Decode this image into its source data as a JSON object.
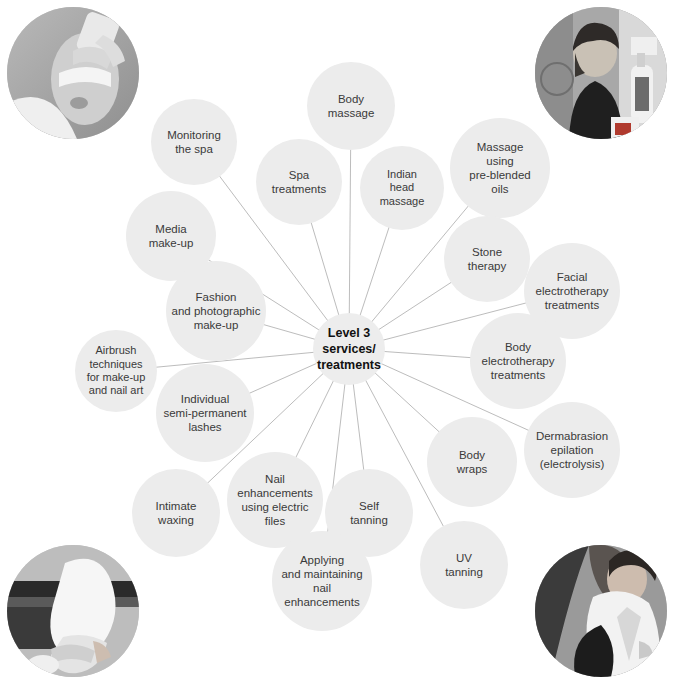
{
  "diagram": {
    "type": "radial-mind-map",
    "canvas": {
      "width": 676,
      "height": 686
    },
    "style": {
      "node_fill": "#ececec",
      "node_text": "#3a3a3a",
      "hub_fill": "#ededed",
      "hub_text": "#111111",
      "edge_color": "#b4b4b4",
      "background": "#ffffff"
    },
    "hub": {
      "label": "Level 3\nservices/\ntreatments",
      "cx": 349,
      "cy": 349,
      "r": 36
    },
    "nodes": [
      {
        "id": "body-massage",
        "label": "Body\nmassage",
        "cx": 351,
        "cy": 106,
        "r": 44
      },
      {
        "id": "monitoring-the-spa",
        "label": "Monitoring\nthe spa",
        "cx": 194,
        "cy": 142,
        "r": 43
      },
      {
        "id": "spa-treatments",
        "label": "Spa\ntreatments",
        "cx": 299,
        "cy": 182,
        "r": 43
      },
      {
        "id": "indian-head-massage",
        "label": "Indian\nhead\nmassage",
        "cx": 402,
        "cy": 188,
        "r": 42
      },
      {
        "id": "massage-pre-blended-oils",
        "label": "Massage\nusing\npre-blended\noils",
        "cx": 500,
        "cy": 168,
        "r": 50
      },
      {
        "id": "media-make-up",
        "label": "Media\nmake-up",
        "cx": 171,
        "cy": 236,
        "r": 45
      },
      {
        "id": "stone-therapy",
        "label": "Stone\ntherapy",
        "cx": 487,
        "cy": 259,
        "r": 43
      },
      {
        "id": "facial-electrotherapy",
        "label": "Facial\nelectrotherapy\ntreatments",
        "cx": 572,
        "cy": 291,
        "r": 48
      },
      {
        "id": "fashion-photographic",
        "label": "Fashion\nand photographic\nmake-up",
        "cx": 216,
        "cy": 311,
        "r": 50
      },
      {
        "id": "airbrush-techniques",
        "label": "Airbrush\ntechniques\nfor make-up\nand nail art",
        "cx": 116,
        "cy": 371,
        "r": 41
      },
      {
        "id": "body-electrotherapy",
        "label": "Body\nelectrotherapy\ntreatments",
        "cx": 518,
        "cy": 361,
        "r": 48
      },
      {
        "id": "individual-lashes",
        "label": "Individual\nsemi-permanent\nlashes",
        "cx": 205,
        "cy": 413,
        "r": 49
      },
      {
        "id": "dermabrasion-epilation",
        "label": "Dermabrasion\nepilation\n(electrolysis)",
        "cx": 572,
        "cy": 450,
        "r": 48
      },
      {
        "id": "body-wraps",
        "label": "Body\nwraps",
        "cx": 472,
        "cy": 462,
        "r": 45
      },
      {
        "id": "nail-enhancements-files",
        "label": "Nail\nenhancements\nusing electric\nfiles",
        "cx": 275,
        "cy": 500,
        "r": 48
      },
      {
        "id": "intimate-waxing",
        "label": "Intimate\nwaxing",
        "cx": 176,
        "cy": 513,
        "r": 44
      },
      {
        "id": "self-tanning",
        "label": "Self\ntanning",
        "cx": 369,
        "cy": 513,
        "r": 44
      },
      {
        "id": "uv-tanning",
        "label": "UV\ntanning",
        "cx": 464,
        "cy": 565,
        "r": 44
      },
      {
        "id": "applying-maintaining",
        "label": "Applying\nand maintaining\nnail\nenhancements",
        "cx": 322,
        "cy": 581,
        "r": 50
      }
    ],
    "photos": [
      {
        "id": "photo-facial-treatment",
        "alt": "facial treatment with eye pads",
        "cx": 73,
        "cy": 73,
        "r": 66,
        "corner": "top-left"
      },
      {
        "id": "photo-therapist-products",
        "alt": "therapist beside product bottles",
        "cx": 601,
        "cy": 73,
        "r": 66,
        "corner": "top-right"
      },
      {
        "id": "photo-towel-hands",
        "alt": "hands holding a rolled white towel",
        "cx": 73,
        "cy": 611,
        "r": 66,
        "corner": "bottom-left"
      },
      {
        "id": "photo-treatment-couch",
        "alt": "therapist treating a client",
        "cx": 601,
        "cy": 611,
        "r": 66,
        "corner": "bottom-right"
      }
    ]
  }
}
